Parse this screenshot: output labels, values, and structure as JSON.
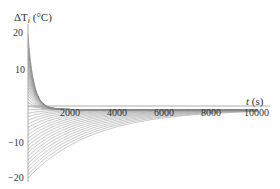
{
  "chart_data": {
    "type": "line",
    "title": "",
    "ylabel": "ΔT_i (°C)",
    "ylabel_main": "ΔT",
    "ylabel_sub": "i",
    "ylabel_unit": "(°C)",
    "xlabel": "t (s)",
    "xlabel_main": "t",
    "xlabel_unit": "(s)",
    "xlim": [
      0,
      10000
    ],
    "ylim": [
      -20,
      20
    ],
    "x_ticks": [
      2000,
      4000,
      6000,
      8000,
      10000
    ],
    "x_tick_labels": [
      "2000",
      "4000",
      "6000",
      "8000",
      "10000"
    ],
    "y_ticks": [
      20,
      10,
      -10,
      -20
    ],
    "y_tick_labels": [
      "20",
      "10",
      "−10",
      "−20"
    ],
    "grid": false,
    "legend": null,
    "series_description": "Family of ~40 temperature-difference curves; each starts at an initial value between +20 and −20 °C at t=0 and decays toward ≈ −1 °C by t≈10000 s. Positive curves decay within ~1500 s; negative curves recover more slowly (≈ 6000–10000 s).",
    "series_initial_values": [
      20,
      17,
      14,
      11,
      8,
      6,
      4,
      2,
      0,
      -1,
      -2,
      -3,
      -4,
      -5,
      -6,
      -7,
      -8,
      -9,
      -10,
      -11,
      -12,
      -13,
      -14,
      -15,
      -16,
      -17,
      -18,
      -19,
      -20
    ],
    "series_final_value_approx": -1,
    "line_color": "#8a8a8a",
    "axis_color": "#888888"
  }
}
